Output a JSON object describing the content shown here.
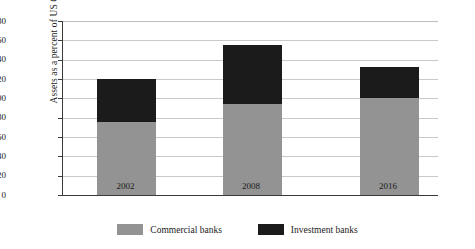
{
  "chart_data": {
    "type": "bar",
    "subtype": "stacked-bar",
    "title": "",
    "xlabel": "",
    "ylabel": "Assets as a percent of US GDP",
    "categories": [
      "2002",
      "2008",
      "2016"
    ],
    "series": [
      {
        "name": "Commercial banks",
        "color": "#939393",
        "values": [
          76,
          94,
          100
        ]
      },
      {
        "name": "Investment banks",
        "color": "#1b1b1b",
        "values": [
          44,
          61,
          32
        ]
      }
    ],
    "totals": [
      120,
      155,
      132
    ],
    "ylim": [
      0,
      180
    ],
    "ytick_labels": [
      "180",
      "160",
      "140",
      "120",
      "100",
      "80",
      "60",
      "40",
      "20",
      "0"
    ],
    "ytick_values": [
      180,
      160,
      140,
      120,
      100,
      80,
      60,
      40,
      20,
      0
    ],
    "grid": true,
    "legend_position": "bottom-center"
  },
  "legend": {
    "items": [
      {
        "label": "Commercial banks",
        "color": "#939393"
      },
      {
        "label": "Investment banks",
        "color": "#1b1b1b"
      }
    ]
  },
  "axis": {
    "y_title": "Assets as a percent of US GDP"
  }
}
